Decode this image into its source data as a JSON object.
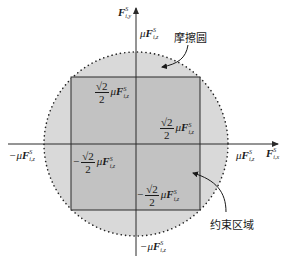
{
  "diagram": {
    "colors": {
      "background": "#ffffff",
      "circle_fill": "#d9d9d9",
      "square_fill": "#c2c2c2",
      "stroke": "#2a2a2a",
      "dots": "#222222"
    },
    "axes": {
      "x_label": {
        "symbol": "F",
        "sup": "S",
        "sub": "i,x"
      },
      "y_label": {
        "symbol": "F",
        "sup": "S",
        "sub": "i,y"
      }
    },
    "labels": {
      "friction_circle": "摩擦圆",
      "constraint_region": "约束区域",
      "top_intercept": {
        "prefix": "μ",
        "symbol": "F",
        "sup": "S",
        "sub": "i,z"
      },
      "bottom_intercept": {
        "prefix": "−μ",
        "symbol": "F",
        "sup": "S",
        "sub": "i,z"
      },
      "left_intercept": {
        "prefix": "−μ",
        "symbol": "F",
        "sup": "S",
        "sub": "i,z"
      },
      "right_intercept": {
        "prefix": "μ",
        "symbol": "F",
        "sup": "S",
        "sub": "i,z"
      },
      "square_top": {
        "sign": "",
        "frac_num": "√2",
        "frac_den": "2",
        "mu": "μ",
        "symbol": "F",
        "sup": "S",
        "sub": "i,z"
      },
      "square_right": {
        "sign": "",
        "frac_num": "√2",
        "frac_den": "2",
        "mu": "μ",
        "symbol": "F",
        "sup": "S",
        "sub": "i,z"
      },
      "square_left": {
        "sign": "−",
        "frac_num": "√2",
        "frac_den": "2",
        "mu": "μ",
        "symbol": "F",
        "sup": "S",
        "sub": "i,z"
      },
      "square_bottom": {
        "sign": "−",
        "frac_num": "√2",
        "frac_den": "2",
        "mu": "μ",
        "symbol": "F",
        "sup": "S",
        "sub": "i,z"
      }
    }
  }
}
